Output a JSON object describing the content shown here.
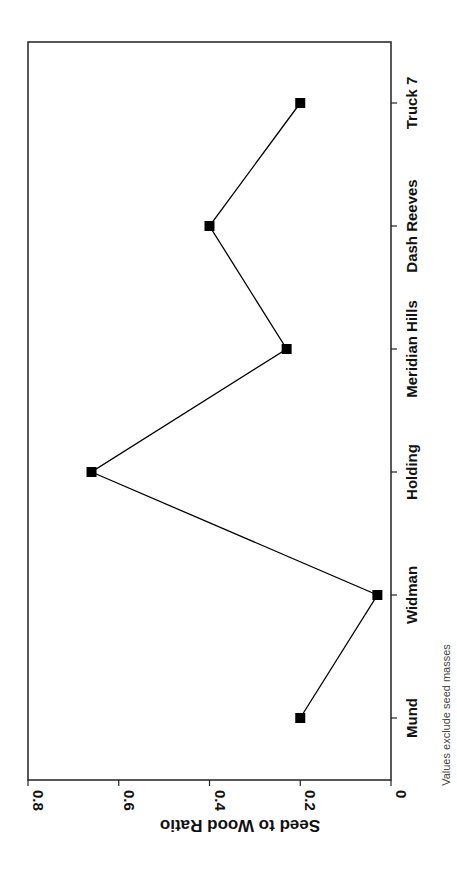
{
  "chart_data": {
    "type": "line",
    "orientation": "rotated-90",
    "title": "",
    "xlabel": "",
    "ylabel": "Seed to Wood Ratio",
    "categories": [
      "Mund",
      "Widman",
      "Holding",
      "Meridian Hills",
      "Dash Reeves",
      "Truck 7"
    ],
    "series": [
      {
        "name": "Seed to Wood Ratio",
        "values": [
          0.2,
          0.03,
          0.66,
          0.23,
          0.4,
          0.2
        ],
        "marker": "square",
        "color": "#000000"
      }
    ],
    "ylim": [
      0,
      0.8
    ],
    "yticks": [
      "0",
      "0.2",
      "0.4",
      "0.6",
      "0.8"
    ],
    "grid": false,
    "legend": "none",
    "annotations": [
      "Values exclude seed masses"
    ]
  },
  "footnote": "Values exclude seed masses"
}
